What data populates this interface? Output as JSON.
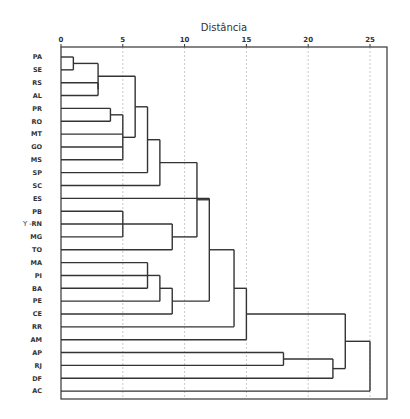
{
  "chart_data": {
    "type": "dendrogram",
    "title": "Distância",
    "xlabel": "Distância",
    "ylabel": "Y",
    "xlim": [
      0,
      26.3
    ],
    "x_ticks": [
      0,
      5,
      10,
      15,
      20,
      25
    ],
    "grid": true,
    "orientation": "horizontal",
    "leaves": [
      "PA",
      "SE",
      "RS",
      "AL",
      "PR",
      "RO",
      "MT",
      "GO",
      "MS",
      "SP",
      "SC",
      "ES",
      "PB",
      "RN",
      "MG",
      "TO",
      "MA",
      "PI",
      "BA",
      "PE",
      "CE",
      "RR",
      "AM",
      "AP",
      "RJ",
      "DF",
      "AC"
    ],
    "merges": [
      {
        "id": "m1",
        "children": [
          "PA",
          "SE"
        ],
        "height": 1
      },
      {
        "id": "m2",
        "children": [
          "RS",
          "AL"
        ],
        "height": 3
      },
      {
        "id": "m3",
        "children": [
          "m1",
          "m2"
        ],
        "height": 3
      },
      {
        "id": "m4",
        "children": [
          "PR",
          "RO"
        ],
        "height": 4
      },
      {
        "id": "m5",
        "children": [
          "m4",
          "MT",
          "GO",
          "MS"
        ],
        "height": 5
      },
      {
        "id": "m6",
        "children": [
          "m3",
          "m5"
        ],
        "height": 6
      },
      {
        "id": "m7",
        "children": [
          "m6",
          "SP"
        ],
        "height": 7
      },
      {
        "id": "m8",
        "children": [
          "m7",
          "SC"
        ],
        "height": 8
      },
      {
        "id": "m9",
        "children": [
          "PB",
          "RN",
          "MG"
        ],
        "height": 5
      },
      {
        "id": "m10",
        "children": [
          "m9",
          "TO"
        ],
        "height": 9
      },
      {
        "id": "m11",
        "children": [
          "m8",
          "m10"
        ],
        "height": 11
      },
      {
        "id": "m12",
        "children": [
          "MA",
          "PI",
          "BA"
        ],
        "height": 7
      },
      {
        "id": "m13",
        "children": [
          "m12",
          "PE"
        ],
        "height": 8
      },
      {
        "id": "m14",
        "children": [
          "m13",
          "CE"
        ],
        "height": 9
      },
      {
        "id": "m15",
        "children": [
          "m11",
          "ES",
          "m14"
        ],
        "height": 12
      },
      {
        "id": "m16",
        "children": [
          "m15",
          "RR"
        ],
        "height": 14
      },
      {
        "id": "m17",
        "children": [
          "m16",
          "AM"
        ],
        "height": 15
      },
      {
        "id": "m18",
        "children": [
          "AP",
          "RJ"
        ],
        "height": 18
      },
      {
        "id": "m19",
        "children": [
          "m18",
          "DF"
        ],
        "height": 22
      },
      {
        "id": "m20",
        "children": [
          "m17",
          "m19"
        ],
        "height": 23
      },
      {
        "id": "m21",
        "children": [
          "m20",
          "AC"
        ],
        "height": 25
      }
    ]
  }
}
